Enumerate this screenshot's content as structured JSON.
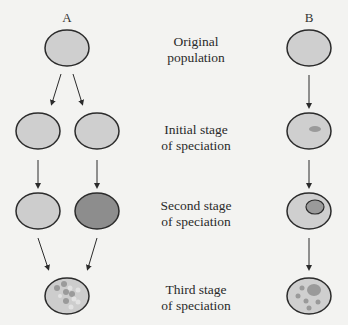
{
  "columns": {
    "a": {
      "label": "A"
    },
    "b": {
      "label": "B"
    }
  },
  "stages": [
    {
      "line1": "Original",
      "line2": "population"
    },
    {
      "line1": "Initial stage",
      "line2": "of speciation"
    },
    {
      "line1": "Second stage",
      "line2": "of speciation"
    },
    {
      "line1": "Third stage",
      "line2": "of speciation"
    }
  ],
  "colors": {
    "population_fill": "#cfcfcf",
    "outline": "#2b2b2b",
    "dark_population_fill": "#8d8d8d",
    "subgroup_fill": "#9a9a9a",
    "light_dot_fill": "#e2e2e2",
    "background": "#f3f3f1"
  }
}
